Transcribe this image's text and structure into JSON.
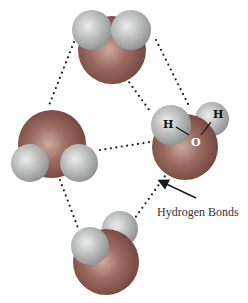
{
  "diagram": {
    "colors": {
      "oxygen": "#8a5a50",
      "oxygen_highlight": "#c9a49b",
      "hydrogen": "#b9bbba",
      "hydrogen_highlight": "#e6e7e6",
      "bond_dots": "#1a1a1a",
      "background": "#ffffff"
    },
    "molecules": [
      {
        "id": "top",
        "atoms": [
          "O",
          "H",
          "H"
        ]
      },
      {
        "id": "left",
        "atoms": [
          "O",
          "H",
          "H"
        ]
      },
      {
        "id": "right",
        "atoms": [
          "O",
          "H",
          "H"
        ],
        "labels": {
          "h1": "H",
          "h2": "H",
          "o": "O"
        }
      },
      {
        "id": "bottom",
        "atoms": [
          "O",
          "H",
          "H"
        ]
      }
    ],
    "annotation": {
      "text": "Hydrogen Bonds",
      "arrow": "arrow pointing to dotted hydrogen bond"
    }
  }
}
